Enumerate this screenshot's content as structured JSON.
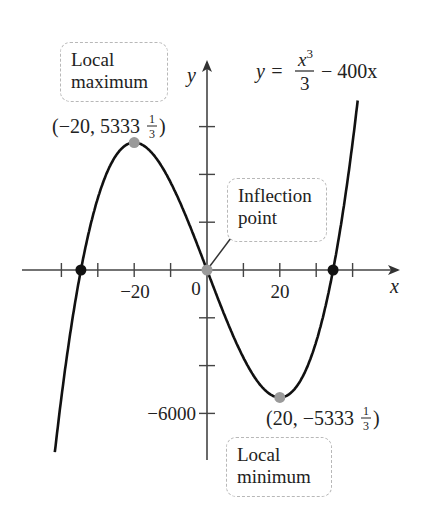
{
  "chart_data": {
    "type": "line",
    "title": "",
    "equation": {
      "lhs": "y =",
      "num": "x",
      "num_exp": "3",
      "den": "3",
      "rest": "− 400x"
    },
    "xlabel": "x",
    "ylabel": "y",
    "function": "y = x^3/3 - 400x",
    "xlim": [
      -42,
      42
    ],
    "ylim": [
      -8000,
      8000
    ],
    "x_ticks": [
      -40,
      -30,
      -20,
      -10,
      0,
      10,
      20,
      30,
      40
    ],
    "x_tick_labels": {
      "-20": "−20",
      "0": "0",
      "20": "20"
    },
    "y_ticks": [
      -6000,
      -4000,
      -2000,
      2000,
      4000,
      6000
    ],
    "y_tick_labels": {
      "-6000": "−6000"
    },
    "grid": false,
    "legend": null,
    "points": [
      {
        "name": "local-maximum",
        "x": -20,
        "y": 5333.33,
        "label": "(−20, 5333",
        "frac_num": "1",
        "frac_den": "3",
        "color": "#9a9a9a"
      },
      {
        "name": "inflection-point",
        "x": 0,
        "y": 0,
        "color": "#9a9a9a"
      },
      {
        "name": "local-minimum",
        "x": 20,
        "y": -5333.33,
        "label": "(20, −5333",
        "frac_num": "1",
        "frac_den": "3",
        "color": "#9a9a9a"
      },
      {
        "name": "root-left",
        "x": -34.64,
        "y": 0,
        "color": "#111111"
      },
      {
        "name": "root-right",
        "x": 34.64,
        "y": 0,
        "color": "#111111"
      }
    ],
    "annotations": [
      {
        "name": "local-maximum",
        "line1": "Local",
        "line2": "maximum"
      },
      {
        "name": "inflection-point",
        "line1": "Inflection",
        "line2": "point"
      },
      {
        "name": "local-minimum",
        "line1": "Local",
        "line2": "minimum"
      }
    ]
  },
  "layout": {
    "origin_px": [
      207,
      270
    ],
    "px_per_x": 3.64,
    "px_per_y": 0.0239,
    "curve_color": "#111111",
    "axis_color": "#444444"
  }
}
